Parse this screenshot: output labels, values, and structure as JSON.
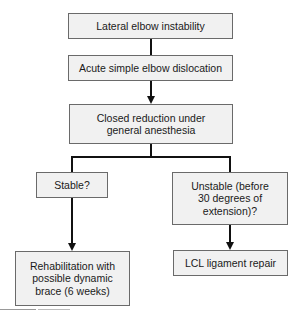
{
  "flowchart": {
    "nodes": {
      "n1": "Lateral elbow instability",
      "n2": "Acute simple elbow dislocation",
      "n3": "Closed reduction under general anesthesia",
      "stable": "Stable?",
      "unstable": "Unstable (before 30 degrees of extension)?",
      "rehab": "Rehabilitation with possible dynamic brace (6 weeks)",
      "lcl": "LCL ligament repair"
    },
    "edges": [
      {
        "from": "n1",
        "to": "n2",
        "arrow": false
      },
      {
        "from": "n2",
        "to": "n3",
        "arrow": true
      },
      {
        "from": "n3",
        "to": "stable",
        "arrow": false
      },
      {
        "from": "n3",
        "to": "unstable",
        "arrow": false
      },
      {
        "from": "stable",
        "to": "rehab",
        "arrow": true
      },
      {
        "from": "unstable",
        "to": "lcl",
        "arrow": true
      }
    ],
    "colors": {
      "box_fill": "#f1f1f1",
      "box_border": "#6a6a6a",
      "connector": "#111111"
    }
  }
}
